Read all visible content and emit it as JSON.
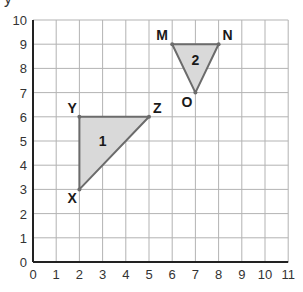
{
  "chart_data": {
    "type": "coordinate-grid",
    "title": "",
    "ylabel": "y",
    "xlim": [
      0,
      11
    ],
    "ylim": [
      0,
      10
    ],
    "x_ticks": [
      "0",
      "1",
      "2",
      "3",
      "4",
      "5",
      "6",
      "7",
      "8",
      "9",
      "10",
      "11"
    ],
    "y_ticks": [
      "0",
      "1",
      "2",
      "3",
      "4",
      "5",
      "6",
      "7",
      "8",
      "9",
      "10"
    ],
    "grid": true,
    "shapes": [
      {
        "name": "triangle-1",
        "label": "1",
        "fill": "#d9d9d9",
        "stroke": "#6b6b6b",
        "vertices": [
          {
            "name": "X",
            "x": 2,
            "y": 3
          },
          {
            "name": "Y",
            "x": 2,
            "y": 6
          },
          {
            "name": "Z",
            "x": 5,
            "y": 6
          }
        ]
      },
      {
        "name": "triangle-2",
        "label": "2",
        "fill": "#d9d9d9",
        "stroke": "#6b6b6b",
        "vertices": [
          {
            "name": "M",
            "x": 6,
            "y": 9
          },
          {
            "name": "N",
            "x": 8,
            "y": 9
          },
          {
            "name": "O",
            "x": 7,
            "y": 7
          }
        ]
      }
    ]
  }
}
